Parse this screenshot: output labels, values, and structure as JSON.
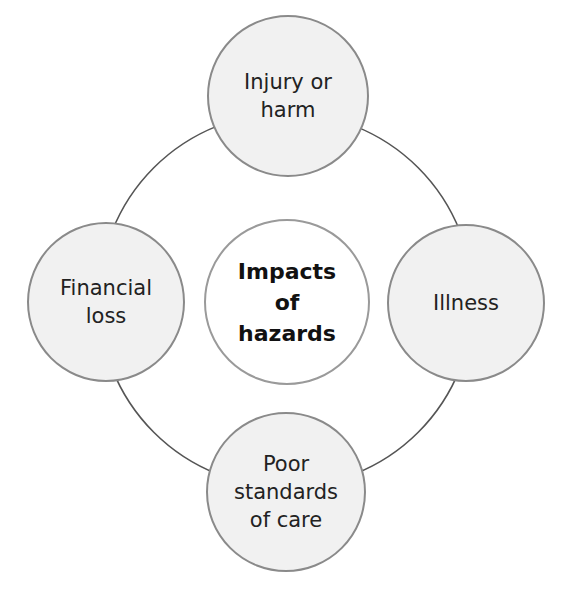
{
  "diagram": {
    "type": "cycle",
    "center": {
      "label": "Impacts\nof\nhazards"
    },
    "nodes": [
      {
        "position": "top",
        "label": "Injury or\nharm"
      },
      {
        "position": "right",
        "label": "Illness"
      },
      {
        "position": "bottom",
        "label": "Poor\nstandards\nof care"
      },
      {
        "position": "left",
        "label": "Financial\nloss"
      }
    ],
    "colors": {
      "node_fill": "#f1f1f1",
      "node_border": "#8a8a8a",
      "center_fill": "#ffffff",
      "ring_stroke": "#555555"
    }
  }
}
